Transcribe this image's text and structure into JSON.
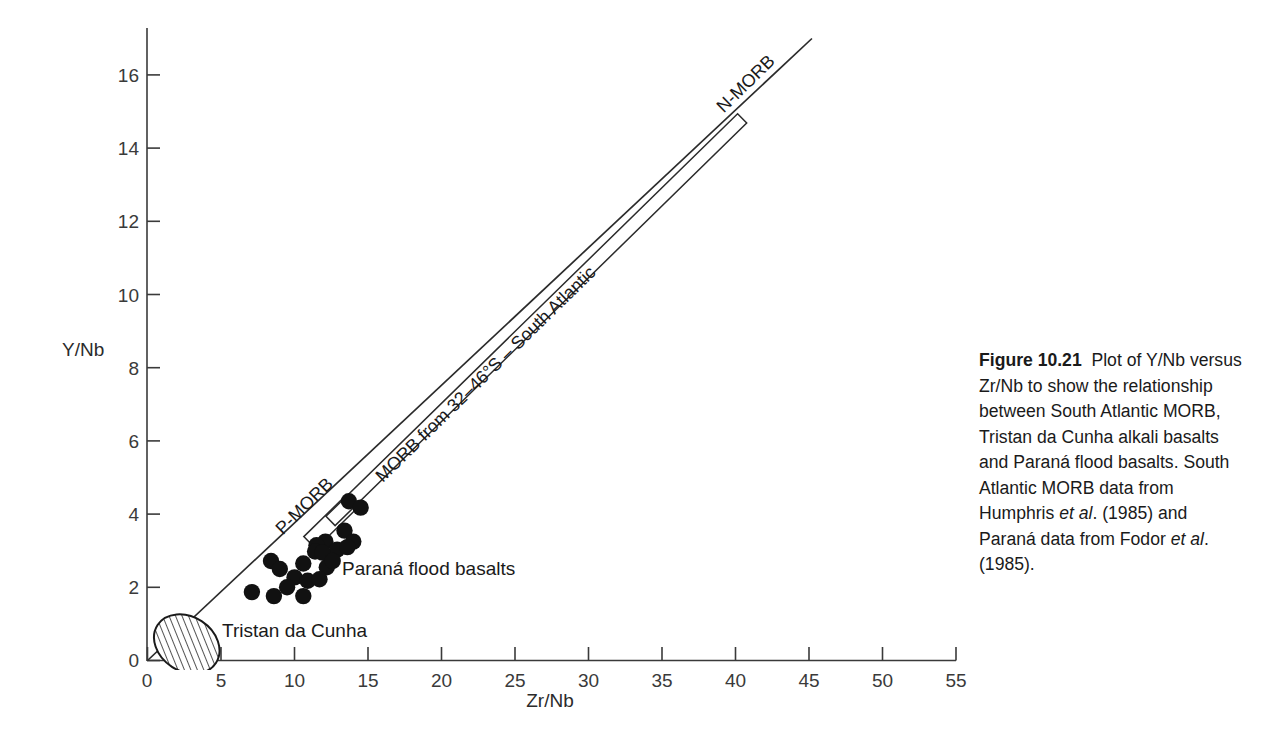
{
  "figure": {
    "number_label": "Figure 10.21",
    "caption_parts": {
      "p1": "Plot of Y/Nb versus Zr/Nb to show the relationship between South Atlantic MORB, Tristan da Cunha alkali basalts and Paraná flood basalts. South Atlantic MORB data from Humphris ",
      "et_al_1": "et al",
      "p2": ". (1985) and Paraná data from Fodor ",
      "et_al_2": "et al",
      "p3": ". (1985)."
    }
  },
  "chart_data": {
    "type": "scatter",
    "title": "",
    "xlabel": "Zr/Nb",
    "ylabel": "Y/Nb",
    "xlim": [
      0,
      55
    ],
    "ylim": [
      0,
      17
    ],
    "xticks": [
      0,
      5,
      10,
      15,
      20,
      25,
      30,
      35,
      40,
      45,
      50,
      55
    ],
    "yticks": [
      0,
      2,
      4,
      6,
      8,
      10,
      12,
      14,
      16
    ],
    "grid": false,
    "legend": "none",
    "series": [
      {
        "name": "Paraná flood basalts",
        "marker": "filled-circle",
        "color": "#111111",
        "points": [
          [
            13.7,
            4.35
          ],
          [
            14.5,
            4.18
          ],
          [
            13.4,
            3.55
          ],
          [
            12.1,
            3.25
          ],
          [
            11.5,
            3.15
          ],
          [
            14.0,
            3.25
          ],
          [
            12.9,
            3.03
          ],
          [
            13.6,
            3.1
          ],
          [
            11.4,
            2.98
          ],
          [
            10.6,
            2.65
          ],
          [
            12.2,
            2.55
          ],
          [
            8.4,
            2.72
          ],
          [
            9.0,
            2.5
          ],
          [
            10.0,
            2.27
          ],
          [
            10.9,
            2.18
          ],
          [
            9.5,
            2.0
          ],
          [
            10.6,
            1.76
          ],
          [
            8.6,
            1.76
          ],
          [
            11.7,
            2.22
          ],
          [
            7.1,
            1.87
          ],
          [
            11.9,
            2.95
          ],
          [
            12.6,
            2.72
          ]
        ]
      }
    ],
    "trend_line": {
      "name": "mantle mixing line",
      "from": [
        0.0,
        0.0
      ],
      "to": [
        45.2,
        17.0
      ]
    },
    "morb_band": {
      "name": "MORB from 32-46°S - South Atlantic",
      "label": "MORB from 32–46°S – South Atlantic",
      "from": [
        12.0,
        4.0
      ],
      "to": [
        40.0,
        15.0
      ]
    },
    "annotations": [
      {
        "id": "n-morb",
        "text": "N-MORB",
        "at": [
          41.5,
          15.6
        ],
        "rotated": true
      },
      {
        "id": "p-morb",
        "text": "P-MORB",
        "at": [
          11.0,
          4.9
        ],
        "rotated": true
      },
      {
        "id": "parana-label",
        "text": "Paraná flood basalts",
        "at": [
          13.4,
          2.35
        ],
        "rotated": false
      },
      {
        "id": "tristan-label",
        "text": "Tristan da Cunha",
        "at": [
          5.3,
          0.75
        ],
        "rotated": false
      }
    ],
    "field_ellipse": {
      "name": "Tristan da Cunha",
      "center": [
        2.67,
        0.45
      ],
      "rx": 1.85,
      "ry": 0.95,
      "rotation_deg": -57,
      "fill": "hatched"
    }
  }
}
